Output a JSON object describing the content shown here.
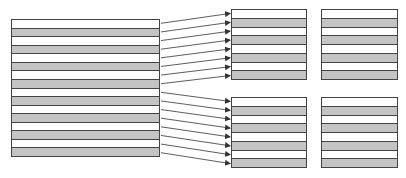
{
  "diagram": {
    "colors": {
      "stripe_gray": "#c4c4c4",
      "stripe_white": "#ffffff",
      "border": "#444444",
      "arrow": "#333333"
    },
    "source_block": {
      "x": 11,
      "y": 19,
      "w": 149,
      "h": 138,
      "rows": [
        "white",
        "gray",
        "white",
        "gray",
        "white",
        "gray",
        "white",
        "gray",
        "white",
        "gray",
        "white",
        "gray",
        "white",
        "gray",
        "white",
        "gray"
      ]
    },
    "target_blocks": [
      {
        "id": "top-left",
        "x": 231,
        "y": 9,
        "w": 76,
        "h": 71,
        "rows": [
          "white",
          "gray",
          "white",
          "gray",
          "white",
          "gray",
          "white",
          "gray"
        ]
      },
      {
        "id": "top-right",
        "x": 321,
        "y": 9,
        "w": 77,
        "h": 71,
        "rows": [
          "white",
          "gray",
          "white",
          "gray",
          "white",
          "gray",
          "white",
          "gray"
        ]
      },
      {
        "id": "bottom-left",
        "x": 231,
        "y": 97,
        "w": 76,
        "h": 71,
        "rows": [
          "white",
          "gray",
          "white",
          "gray",
          "white",
          "gray",
          "white",
          "gray"
        ]
      },
      {
        "id": "bottom-right",
        "x": 321,
        "y": 97,
        "w": 77,
        "h": 71,
        "rows": [
          "white",
          "gray",
          "white",
          "gray",
          "white",
          "gray",
          "white",
          "gray"
        ]
      }
    ],
    "arrows": {
      "count": 16,
      "from": "source_block rows 1-16 (right edge)",
      "to": "top-left rows 1-8 and bottom-left rows 1-8 (left edge)"
    }
  }
}
